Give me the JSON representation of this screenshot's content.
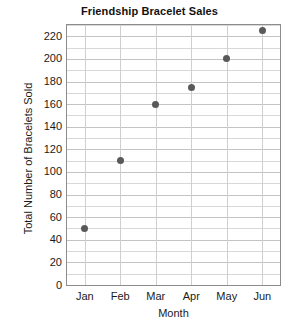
{
  "chart_data": {
    "type": "scatter",
    "title": "Friendship Bracelet Sales",
    "xlabel": "Month",
    "ylabel": "Total Number of Bracelets Sold",
    "categories": [
      "Jan",
      "Feb",
      "Mar",
      "Apr",
      "May",
      "Jun"
    ],
    "values": [
      50,
      110,
      160,
      175,
      200,
      225
    ],
    "points": [
      {
        "x": "Jan",
        "y": 50
      },
      {
        "x": "Feb",
        "y": 110
      },
      {
        "x": "Mar",
        "y": 160
      },
      {
        "x": "Apr",
        "y": 175
      },
      {
        "x": "May",
        "y": 200
      },
      {
        "x": "Jun",
        "y": 225
      }
    ],
    "ylim": [
      0,
      230
    ],
    "ytick_labels": [
      "0",
      "20",
      "40",
      "60",
      "80",
      "100",
      "120",
      "140",
      "160",
      "180",
      "200",
      "220"
    ],
    "ytick_values": [
      0,
      20,
      40,
      60,
      80,
      100,
      120,
      140,
      160,
      180,
      200,
      220
    ],
    "y_minor_step": 10,
    "grid": "both",
    "legend": "none",
    "marker_color": "#595959",
    "grid_color": "#d8d8d8",
    "axis_color": "#8c8c8c",
    "background": "#ffffff"
  }
}
